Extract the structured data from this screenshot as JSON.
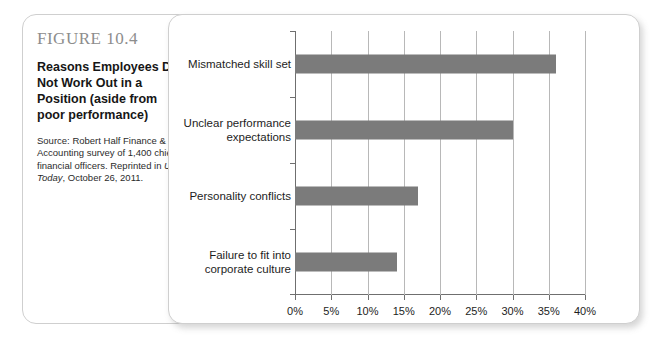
{
  "figure": {
    "number": "FIGURE 10.4",
    "title": "Reasons Employees Do Not Work Out in a Position (aside from poor performance)",
    "source_prefix": "Source: Robert Half Finance & Accounting survey of 1,400 chief financial officers. Reprinted in ",
    "source_italic": "USA Today",
    "source_suffix": ", October 26, 2011."
  },
  "colors": {
    "bar": "#7b7b7b",
    "axis": "#6f6f6f",
    "grid": "#b8b8b8",
    "panel_border": "#cfcfcf",
    "figure_number": "#8d8d8d"
  },
  "chart_data": {
    "type": "bar",
    "orientation": "horizontal",
    "title": "Reasons Employees Do Not Work Out in a Position (aside from poor performance)",
    "categories": [
      "Mismatched skill set",
      "Unclear performance expectations",
      "Personality conflicts",
      "Failure to fit into corporate culture"
    ],
    "values": [
      36,
      30,
      17,
      14
    ],
    "xlabel": "",
    "ylabel": "",
    "xlim": [
      0,
      40
    ],
    "xticks": [
      0,
      5,
      10,
      15,
      20,
      25,
      30,
      35,
      40
    ],
    "xtick_labels": [
      "0%",
      "5%",
      "10%",
      "15%",
      "20%",
      "25%",
      "30%",
      "35%",
      "40%"
    ],
    "grid": true,
    "grid_axis": "x",
    "legend": false,
    "value_labels": false
  }
}
